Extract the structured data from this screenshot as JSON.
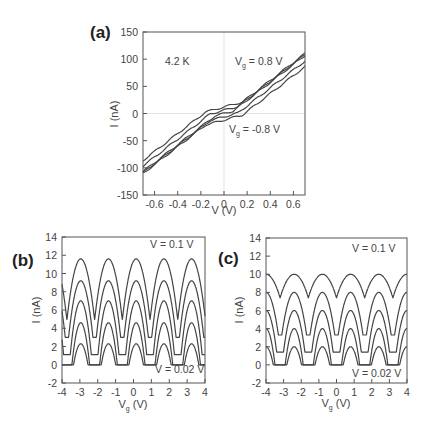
{
  "chart_data": [
    {
      "panel": "(a)",
      "type": "line",
      "title": "",
      "xlabel": "V (V)",
      "ylabel": "I (nA)",
      "xlim": [
        -0.7,
        0.7
      ],
      "ylim": [
        -150,
        150
      ],
      "xticks": [
        -0.6,
        -0.4,
        -0.2,
        0,
        0.2,
        0.4,
        0.6
      ],
      "xtick_labels": [
        "-0.6",
        "-0.4",
        "-0.2",
        "0",
        "0.2",
        "0.4",
        "0.6"
      ],
      "yticks": [
        -150,
        -100,
        -50,
        0,
        50,
        100,
        150
      ],
      "ytick_labels": [
        "-150",
        "-100",
        "-50",
        "0",
        "50",
        "100",
        "150"
      ],
      "zero_lines": true,
      "annotations": [
        {
          "text": "4.2 K",
          "x": -0.5,
          "y": 100
        },
        {
          "text": "Vg = 0.8 V",
          "x": 0.3,
          "y": 100
        },
        {
          "text": "Vg = -0.8 V",
          "x": 0.07,
          "y": -25
        }
      ],
      "series": [
        {
          "name": "Vg = 0.8 V",
          "offset": 12,
          "slope": 165,
          "gap": 0.16,
          "points": [
            [
              -0.7,
              -103
            ],
            [
              -0.16,
              -10
            ],
            [
              0.16,
              18
            ],
            [
              0.7,
              130
            ]
          ]
        },
        {
          "name": "Vg = 0.4 V",
          "offset": 6,
          "slope": 165,
          "gap": 0.12,
          "points": [
            [
              -0.7,
              -109
            ],
            [
              0.7,
              121
            ]
          ]
        },
        {
          "name": "Vg = 0 V",
          "offset": 0,
          "slope": 165,
          "gap": 0.08,
          "points": [
            [
              -0.7,
              -115
            ],
            [
              0.7,
              115
            ]
          ]
        },
        {
          "name": "Vg = -0.4 V",
          "offset": -6,
          "slope": 165,
          "gap": 0.12,
          "points": [
            [
              -0.7,
              -121
            ],
            [
              0.7,
              109
            ]
          ]
        },
        {
          "name": "Vg = -0.8 V",
          "offset": -12,
          "slope": 165,
          "gap": 0.16,
          "points": [
            [
              -0.7,
              -130
            ],
            [
              0.7,
              100
            ]
          ]
        }
      ]
    },
    {
      "panel": "(b)",
      "type": "line",
      "xlabel": "Vg (V)",
      "ylabel": "I (nA)",
      "xlim": [
        -4,
        4
      ],
      "ylim": [
        -2,
        14
      ],
      "xticks": [
        -4,
        -3,
        -2,
        -1,
        0,
        1,
        2,
        3,
        4
      ],
      "xtick_labels": [
        "-4",
        "-3",
        "-2",
        "-1",
        "0",
        "1",
        "2",
        "3",
        "4"
      ],
      "yticks": [
        -2,
        0,
        2,
        4,
        6,
        8,
        10,
        12,
        14
      ],
      "ytick_labels": [
        "-2",
        "0",
        "2",
        "4",
        "6",
        "8",
        "10",
        "12",
        "14"
      ],
      "annotations": [
        {
          "text": "V = 0.1 V",
          "position": "top-right"
        },
        {
          "text": "V = 0.02 V",
          "position": "bottom-right"
        }
      ],
      "period": 1.55,
      "peak_phase": 0.15,
      "series": [
        {
          "name": "V = 0.1 V",
          "peak": 11.6,
          "valley": 4.9
        },
        {
          "name": "V = 0.08 V",
          "peak": 9.2,
          "valley": 3.0
        },
        {
          "name": "V = 0.06 V",
          "peak": 7.0,
          "valley": 1.1
        },
        {
          "name": "V = 0.04 V",
          "peak": 4.6,
          "valley": 0
        },
        {
          "name": "V = 0.02 V",
          "peak": 2.3,
          "valley": 0
        }
      ]
    },
    {
      "panel": "(c)",
      "type": "line",
      "xlabel": "Vg (V)",
      "ylabel": "I (nA)",
      "xlim": [
        -4,
        4
      ],
      "ylim": [
        -2,
        14
      ],
      "xticks": [
        -4,
        -3,
        -2,
        -1,
        0,
        1,
        2,
        3,
        4
      ],
      "xtick_labels": [
        "-4",
        "-3",
        "-2",
        "-1",
        "0",
        "1",
        "2",
        "3",
        "4"
      ],
      "yticks": [
        -2,
        0,
        2,
        4,
        6,
        8,
        10,
        12,
        14
      ],
      "ytick_labels": [
        "-2",
        "0",
        "2",
        "4",
        "6",
        "8",
        "10",
        "12",
        "14"
      ],
      "annotations": [
        {
          "text": "V = 0.1 V",
          "position": "top-right"
        },
        {
          "text": "V = 0.02 V",
          "position": "bottom-right"
        }
      ],
      "period": 1.6,
      "peak_phase": 0.8,
      "series": [
        {
          "name": "V = 0.1 V",
          "peak": 10.0,
          "valley": 7.4
        },
        {
          "name": "V = 0.08 V",
          "peak": 8.0,
          "valley": 3.3
        },
        {
          "name": "V = 0.06 V",
          "peak": 6.0,
          "valley": 1.4
        },
        {
          "name": "V = 0.04 V",
          "peak": 4.0,
          "valley": 0
        },
        {
          "name": "V = 0.02 V",
          "peak": 2.0,
          "valley": 0
        }
      ]
    }
  ],
  "labels": {
    "panel_a": "(a)",
    "panel_b": "(b)",
    "panel_c": "(c)",
    "a_xlabel": "V (V)",
    "a_ylabel": "I (nA)",
    "a_temp": "4.2 K",
    "a_vg_high_main": "V",
    "a_vg_sub": "g",
    "a_vg_high_val": " = 0.8 V",
    "a_vg_low_val": " = -0.8 V",
    "b_ylabel": "I (nA)",
    "b_xlabel_main": "V",
    "b_xlabel_sub": "g",
    "b_xlabel_unit": " (V)",
    "b_top": "V = 0.1 V",
    "b_bottom": "V = 0.02 V",
    "c_ylabel": "I (nA)",
    "c_top": "V = 0.1 V",
    "c_bottom": "V = 0.02 V"
  }
}
